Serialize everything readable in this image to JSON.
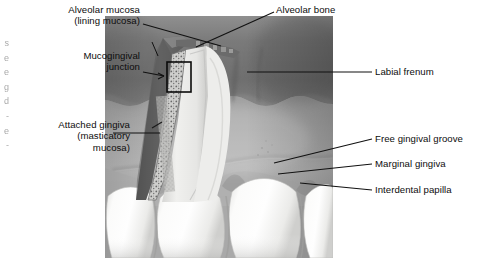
{
  "figure": {
    "type": "labeled anatomical illustration",
    "style": "grayscale medical illustration with leader lines",
    "colors": {
      "background": "#ffffff",
      "leader_line": "#111111",
      "label_text": "#0d0d0d",
      "alveolar_mucosa_dark": "#6e6e6e",
      "alveolar_mucosa_mid": "#848484",
      "attached_gingiva": "#9a9a9a",
      "attached_gingiva_light": "#b4b4b4",
      "marginal_gingiva": "#a9a9a9",
      "tooth_enamel": "#f2f2f0",
      "tooth_shadow": "#d2d2d0",
      "cutaway_bone": "#5a5a5a",
      "cutaway_ligament": "#c9c9c9",
      "root_dentin": "#e3e3e1",
      "highlight_box": "#0a0a0a"
    }
  },
  "labels": [
    {
      "id": "alveolar-mucosa",
      "text": "Alveolar mucosa\n(lining mucosa)",
      "align": "right",
      "x": 18,
      "y": 4,
      "width": 122
    },
    {
      "id": "mucogingival-junction",
      "text": "Mucogingival\njunction",
      "align": "right",
      "x": 18,
      "y": 50,
      "width": 122
    },
    {
      "id": "attached-gingiva",
      "text": "Attached gingiva\n(masticatory\nmucosa)",
      "align": "right",
      "x": 8,
      "y": 119,
      "width": 122
    },
    {
      "id": "alveolar-bone",
      "text": "Alveolar bone",
      "align": "left",
      "x": 276,
      "y": 4,
      "width": 110
    },
    {
      "id": "labial-frenum",
      "text": "Labial frenum",
      "align": "left",
      "x": 375,
      "y": 66,
      "width": 104
    },
    {
      "id": "free-gingival-groove",
      "text": "Free gingival groove",
      "align": "left",
      "x": 375,
      "y": 133,
      "width": 104
    },
    {
      "id": "marginal-gingiva",
      "text": "Marginal gingiva",
      "align": "left",
      "x": 375,
      "y": 158,
      "width": 104
    },
    {
      "id": "interdental-papilla",
      "text": "Interdental papilla",
      "align": "left",
      "x": 375,
      "y": 184,
      "width": 104
    }
  ],
  "edge_bleed": {
    "text": "s\ne\ne\ng\nd\n-\ne\n-\nl"
  },
  "annotations": {
    "highlight_box_label": "magnified-region-box",
    "cutaway_label": "sagittal cutaway through tooth and alveolus"
  }
}
